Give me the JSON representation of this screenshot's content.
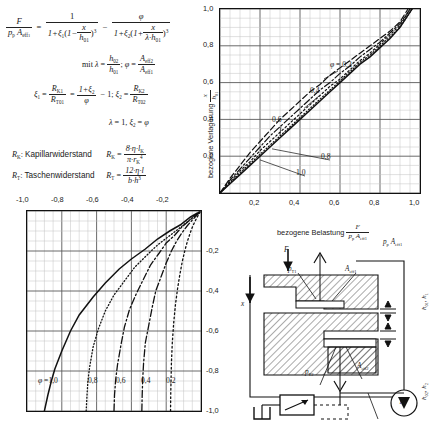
{
  "formula": {
    "main": {
      "lhs_num": "F",
      "lhs_den": "p_p A_eff1",
      "eq": "=",
      "t1_num": "1",
      "t1_den": "1 + ξ₁(1 − x/h₀₁)³",
      "minus": "−",
      "t2_num": "φ",
      "t2_den": "1 + ξ₂(1 + x/(λ·h₀₁))³"
    },
    "mit": {
      "prefix": "mit",
      "lambda_def": "λ = h₀₂/h₀₁",
      "sep": ";",
      "phi_def": "φ = A_eff2/A_eff1"
    },
    "xi": {
      "xi1": "ξ₁ = R_K1/R_T01 = (1+ξ₂)/φ − 1",
      "sep": ";",
      "xi2": "ξ₂ = R_K2/R_T02"
    },
    "special_case": "λ = 1, ξ₂ = φ",
    "legend": [
      {
        "symbol": "R_K",
        "name": "Kapillarwiderstand",
        "expr_num": "8 · η · l_K",
        "expr_den": "π · r_K⁴"
      },
      {
        "symbol": "R_T",
        "name": "Taschenwiderstand",
        "expr_num": "12 · η · l",
        "expr_den": "b · h³"
      }
    ]
  },
  "chart_upper_right": {
    "type": "line",
    "xlabel": "bezogene Belastung",
    "xlabel_fraction": {
      "num": "F",
      "den": "p_p A_eff1"
    },
    "ylabel": "bezogene Verlagerung",
    "ylabel_fraction": {
      "num": "x",
      "den": "h_01"
    },
    "xlim": [
      0,
      1
    ],
    "ylim": [
      0,
      1
    ],
    "xticks": [
      "0,2",
      "0,4",
      "0,6",
      "0,8",
      "1,0"
    ],
    "xtick_values": [
      0.2,
      0.4,
      0.6,
      0.8,
      1.0
    ],
    "yticks": [
      "0,2",
      "0,4",
      "0,6",
      "0,8",
      "1,0"
    ],
    "ytick_values": [
      0.2,
      0.4,
      0.6,
      0.8,
      1.0
    ],
    "grid": true,
    "grid_minor_step": 0.05,
    "grid_major_step": 0.2,
    "legend_position": "inline-labels",
    "series": [
      {
        "name": "φ = 0,2",
        "label": "0,2",
        "style": "dashed",
        "x": [
          0.0,
          0.05,
          0.1,
          0.15,
          0.2,
          0.25,
          0.3,
          0.35,
          0.4,
          0.45,
          0.5,
          0.55,
          0.6,
          0.65,
          0.7,
          0.75,
          0.8,
          0.85,
          0.9,
          0.94
        ],
        "y": [
          0.0,
          0.08,
          0.15,
          0.22,
          0.28,
          0.34,
          0.4,
          0.45,
          0.5,
          0.55,
          0.59,
          0.64,
          0.68,
          0.72,
          0.76,
          0.8,
          0.84,
          0.88,
          0.93,
          1.0
        ]
      },
      {
        "name": "φ = 0,4",
        "label": "0,4",
        "style": "dash-dot",
        "x": [
          0.0,
          0.05,
          0.1,
          0.15,
          0.2,
          0.25,
          0.3,
          0.35,
          0.4,
          0.45,
          0.5,
          0.55,
          0.6,
          0.65,
          0.7,
          0.75,
          0.8,
          0.85,
          0.9,
          0.95
        ],
        "y": [
          0.0,
          0.07,
          0.13,
          0.19,
          0.25,
          0.31,
          0.36,
          0.41,
          0.46,
          0.51,
          0.56,
          0.6,
          0.65,
          0.69,
          0.74,
          0.78,
          0.82,
          0.87,
          0.92,
          1.0
        ]
      },
      {
        "name": "φ = 0,6",
        "label": "0,6",
        "style": "dotted",
        "x": [
          0.0,
          0.05,
          0.1,
          0.15,
          0.2,
          0.25,
          0.3,
          0.35,
          0.4,
          0.45,
          0.5,
          0.55,
          0.6,
          0.65,
          0.7,
          0.75,
          0.8,
          0.85,
          0.9,
          0.95
        ],
        "y": [
          0.0,
          0.06,
          0.12,
          0.17,
          0.23,
          0.28,
          0.33,
          0.38,
          0.43,
          0.48,
          0.53,
          0.58,
          0.62,
          0.67,
          0.72,
          0.76,
          0.81,
          0.86,
          0.91,
          1.0
        ]
      },
      {
        "name": "φ = 0,8",
        "label": "0,8",
        "style": "fine-dotted",
        "x": [
          0.0,
          0.05,
          0.1,
          0.15,
          0.2,
          0.25,
          0.3,
          0.35,
          0.4,
          0.45,
          0.5,
          0.55,
          0.6,
          0.65,
          0.7,
          0.75,
          0.8,
          0.85,
          0.9,
          0.96
        ],
        "y": [
          0.0,
          0.055,
          0.11,
          0.16,
          0.21,
          0.26,
          0.31,
          0.36,
          0.41,
          0.46,
          0.51,
          0.56,
          0.61,
          0.66,
          0.71,
          0.75,
          0.8,
          0.85,
          0.9,
          1.0
        ]
      },
      {
        "name": "φ = 1,0",
        "label": "1,0",
        "style": "solid",
        "x": [
          0.0,
          0.05,
          0.1,
          0.15,
          0.2,
          0.25,
          0.3,
          0.35,
          0.4,
          0.45,
          0.5,
          0.55,
          0.6,
          0.65,
          0.7,
          0.75,
          0.8,
          0.85,
          0.9,
          0.96
        ],
        "y": [
          0.0,
          0.05,
          0.1,
          0.15,
          0.2,
          0.25,
          0.3,
          0.35,
          0.4,
          0.45,
          0.5,
          0.55,
          0.6,
          0.65,
          0.7,
          0.74,
          0.79,
          0.84,
          0.9,
          1.0
        ]
      }
    ],
    "annotations": [
      {
        "text": "φ = 0,2",
        "lead_to_x": 0.52,
        "lead_to_y": 0.62
      },
      {
        "text": "0,4",
        "lead_to_x": 0.42,
        "lead_to_y": 0.46
      },
      {
        "text": "0,6",
        "lead_to_x": 0.3,
        "lead_to_y": 0.31
      },
      {
        "text": "0,8",
        "lead_to_x": 0.26,
        "lead_to_y": 0.24
      },
      {
        "text": "1,0",
        "lead_to_x": 0.2,
        "lead_to_y": 0.18
      }
    ]
  },
  "chart_lower_left": {
    "type": "line",
    "xlim": [
      -1,
      0
    ],
    "ylim": [
      -1,
      0
    ],
    "xticks": [
      "-1,0",
      "-0,8",
      "-0,6",
      "-0,4",
      "-0,2"
    ],
    "xtick_values": [
      -1.0,
      -0.8,
      -0.6,
      -0.4,
      -0.2
    ],
    "yticks": [
      "-0,2",
      "-0,4",
      "-0,6",
      "-0,8",
      "-1,0"
    ],
    "ytick_values": [
      -0.2,
      -0.4,
      -0.6,
      -0.8,
      -1.0
    ],
    "grid": true,
    "grid_minor_step": 0.05,
    "grid_major_step": 0.2,
    "series": [
      {
        "name": "φ = 1,0",
        "label": "1,0",
        "style": "solid",
        "x": [
          -0.9,
          -0.88,
          -0.86,
          -0.84,
          -0.8,
          -0.75,
          -0.7,
          -0.62,
          -0.55,
          -0.47,
          -0.4,
          -0.32,
          -0.25,
          -0.18,
          -0.12,
          -0.06,
          -0.02
        ],
        "y": [
          -1.0,
          -0.92,
          -0.85,
          -0.79,
          -0.7,
          -0.6,
          -0.52,
          -0.43,
          -0.36,
          -0.29,
          -0.24,
          -0.19,
          -0.14,
          -0.1,
          -0.07,
          -0.03,
          -0.01
        ]
      },
      {
        "name": "φ = 0,8",
        "label": "0,8",
        "style": "fine-dotted",
        "x": [
          -0.66,
          -0.655,
          -0.65,
          -0.64,
          -0.62,
          -0.59,
          -0.55,
          -0.5,
          -0.44,
          -0.38,
          -0.31,
          -0.25,
          -0.19,
          -0.13,
          -0.08,
          -0.03,
          -0.01
        ],
        "y": [
          -1.0,
          -0.92,
          -0.85,
          -0.78,
          -0.68,
          -0.59,
          -0.5,
          -0.42,
          -0.35,
          -0.28,
          -0.22,
          -0.17,
          -0.13,
          -0.09,
          -0.055,
          -0.02,
          -0.005
        ]
      },
      {
        "name": "φ = 0,6",
        "label": "0,6",
        "style": "dash-dot",
        "x": [
          -0.5,
          -0.497,
          -0.49,
          -0.48,
          -0.46,
          -0.44,
          -0.41,
          -0.37,
          -0.33,
          -0.29,
          -0.24,
          -0.2,
          -0.15,
          -0.11,
          -0.07,
          -0.03,
          -0.01
        ],
        "y": [
          -1.0,
          -0.92,
          -0.84,
          -0.77,
          -0.67,
          -0.58,
          -0.49,
          -0.41,
          -0.34,
          -0.27,
          -0.21,
          -0.16,
          -0.12,
          -0.08,
          -0.05,
          -0.02,
          -0.005
        ]
      },
      {
        "name": "φ = 0,4",
        "label": "0,4",
        "style": "dash-dot",
        "x": [
          -0.34,
          -0.338,
          -0.335,
          -0.33,
          -0.32,
          -0.3,
          -0.28,
          -0.26,
          -0.23,
          -0.2,
          -0.17,
          -0.14,
          -0.11,
          -0.08,
          -0.05,
          -0.02,
          -0.005
        ],
        "y": [
          -1.0,
          -0.92,
          -0.84,
          -0.76,
          -0.66,
          -0.57,
          -0.48,
          -0.4,
          -0.33,
          -0.26,
          -0.2,
          -0.15,
          -0.11,
          -0.075,
          -0.045,
          -0.018,
          -0.004
        ]
      },
      {
        "name": "φ = 0,2",
        "label": "0,2",
        "style": "dotted",
        "x": [
          -0.175,
          -0.174,
          -0.172,
          -0.17,
          -0.165,
          -0.157,
          -0.147,
          -0.135,
          -0.122,
          -0.107,
          -0.092,
          -0.077,
          -0.061,
          -0.046,
          -0.03,
          -0.015,
          -0.004
        ],
        "y": [
          -1.0,
          -0.92,
          -0.84,
          -0.76,
          -0.66,
          -0.56,
          -0.47,
          -0.39,
          -0.32,
          -0.25,
          -0.195,
          -0.148,
          -0.107,
          -0.073,
          -0.044,
          -0.02,
          -0.004
        ]
      }
    ],
    "inline_labels": [
      {
        "text": "φ = 1,0",
        "x": -0.77,
        "y": -0.8
      },
      {
        "text": "0,8",
        "x": -0.555,
        "y": -0.8
      },
      {
        "text": "0,6",
        "x": -0.395,
        "y": -0.8
      },
      {
        "text": "0,4",
        "x": -0.255,
        "y": -0.8
      },
      {
        "text": "0,2",
        "x": -0.115,
        "y": -0.8
      }
    ]
  },
  "schematic": {
    "name": "hydrostatisches Lager",
    "labels": {
      "force": "F",
      "displacement": "x",
      "pocket_pressure_1": "p_T1",
      "pocket_pressure_2": "p_T2",
      "area_1": "A_eff1",
      "area_2": "A_eff2",
      "gap_1": "h_01, h_1",
      "gap_2": "h_02, h_2",
      "supply_pressure": "p_p"
    },
    "components": [
      "valve",
      "tank",
      "pump"
    ]
  }
}
